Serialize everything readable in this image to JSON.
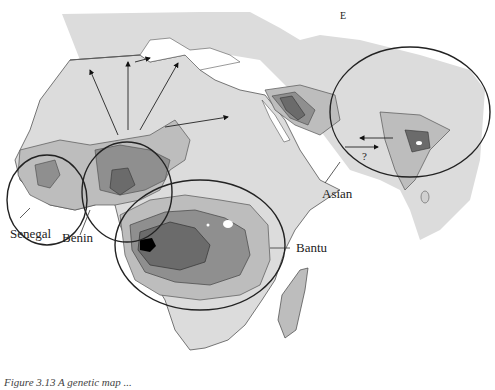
{
  "figure": {
    "type": "map",
    "labels": {
      "senegal": "Senegal",
      "benin": "Benin",
      "bantu": "Bantu",
      "asian": "Asian",
      "question": "?",
      "north_marker": "E"
    },
    "caption": "Figure 3.13  A genetic map ...",
    "colors": {
      "land_light": "#d9d9d9",
      "level_1": "#b9b9b9",
      "level_2": "#8f8f8f",
      "level_3": "#6b6b6b",
      "level_4": "#000000",
      "outline": "#333333",
      "sea": "#ffffff"
    },
    "regions": [
      {
        "name": "Senegal",
        "shape": "ellipse"
      },
      {
        "name": "Benin",
        "shape": "ellipse"
      },
      {
        "name": "Bantu",
        "shape": "ellipse"
      },
      {
        "name": "Asian",
        "shape": "ellipse"
      }
    ]
  }
}
